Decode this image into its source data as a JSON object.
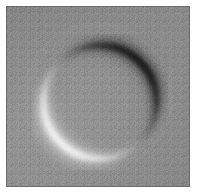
{
  "image": {
    "title": "Grayscale ring-shaped object",
    "width": 203,
    "height": 195,
    "modality": "differential-interference-contrast-micrograph",
    "background_color": "#ffffff",
    "panel_color": "#8d8d8d",
    "border_color": "#6b6b6b",
    "panel": {
      "x": 6,
      "y": 6,
      "width": 184,
      "height": 181
    }
  },
  "object": {
    "name": "ring",
    "shape": "circle",
    "center_x": 100,
    "center_y": 102,
    "radius": 57,
    "ring_thickness": 9,
    "shading_axis_degrees": 45,
    "dark_arc": {
      "label": "dark-arc",
      "color": "#161616",
      "position": "upper-right",
      "peak_x": 143,
      "peak_y": 48
    },
    "bright_arc": {
      "label": "bright-arc",
      "color": "#fbfbfb",
      "position": "lower-left",
      "peak_x": 70,
      "peak_y": 152
    },
    "interior_color": "#8f8f8f"
  },
  "chart_data": {
    "type": "heatmap",
    "xlabel": "",
    "ylabel": "",
    "colormap": "gray",
    "value_range": [
      0,
      255
    ],
    "background_value": 141,
    "annotations": [
      {
        "label": "dark-arc-minimum",
        "x": 143,
        "y": 48,
        "value": 22
      },
      {
        "label": "bright-arc-maximum",
        "x": 70,
        "y": 152,
        "value": 250
      },
      {
        "label": "ring-interior",
        "x": 100,
        "y": 102,
        "value": 143
      },
      {
        "label": "field-background",
        "x": 25,
        "y": 25,
        "value": 140
      }
    ]
  }
}
